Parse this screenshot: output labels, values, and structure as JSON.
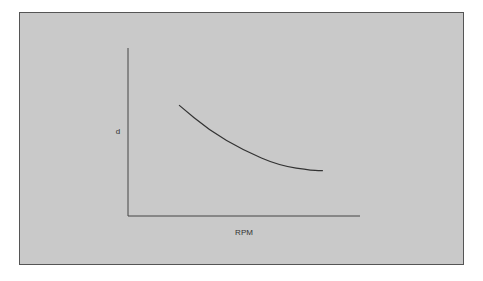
{
  "chart_data": {
    "type": "line",
    "title": "",
    "xlabel": "RPM",
    "ylabel": "d",
    "grid": false,
    "xlim": [
      0,
      1
    ],
    "ylim": [
      0,
      1
    ],
    "series": [
      {
        "name": "d vs RPM",
        "x": [
          0.22,
          0.35,
          0.5,
          0.65,
          0.8,
          0.84
        ],
        "y": [
          0.66,
          0.51,
          0.39,
          0.3,
          0.27,
          0.27
        ]
      }
    ]
  },
  "colors": {
    "background": "#c9c9c9",
    "line": "#333333"
  }
}
